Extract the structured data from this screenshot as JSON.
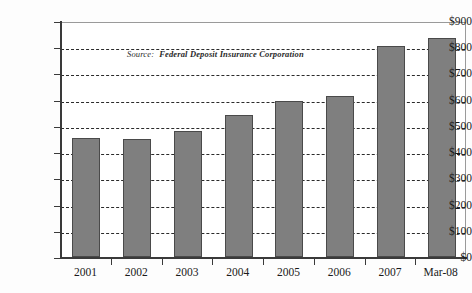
{
  "chart_data": {
    "type": "bar",
    "title": "",
    "subtitle": "",
    "xlabel": "",
    "ylabel": "",
    "categories": [
      "2001",
      "2002",
      "2003",
      "2004",
      "2005",
      "2006",
      "2007",
      "Mar-08"
    ],
    "values": [
      455,
      450,
      480,
      540,
      595,
      615,
      805,
      835
    ],
    "ylim": [
      0,
      900
    ],
    "ytick_values": [
      0,
      100,
      200,
      300,
      400,
      500,
      600,
      700,
      800,
      900
    ],
    "ytick_labels": [
      "$0",
      "$100",
      "$200",
      "$300",
      "$400",
      "$500",
      "$600",
      "$700",
      "$800",
      "$900"
    ],
    "grid": true,
    "grid_style": "dashed-horizontal",
    "legend": "none",
    "bar_color": "#7f7f7f",
    "bar_border_color": "#4a4a4a",
    "annotations": [
      {
        "name": "source-note",
        "label": "Source:",
        "text": "Federal Deposit Insurance Corporation"
      }
    ]
  },
  "annotation": {
    "source_label": "Source:",
    "source_text": "Federal Deposit Insurance Corporation"
  }
}
